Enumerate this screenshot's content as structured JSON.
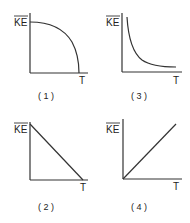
{
  "panels": [
    {
      "id": "1",
      "caption": "( 1 )",
      "ylabel": "KE",
      "xlabel": "T",
      "shape": "quarter-ellipse decreasing (concave down) from max at T=0 to zero"
    },
    {
      "id": "2",
      "caption": "( 2 )",
      "ylabel": "KE",
      "xlabel": "T",
      "shape": "straight line decreasing linearly to zero"
    },
    {
      "id": "3",
      "caption": "( 3 )",
      "ylabel": "KE",
      "xlabel": "T",
      "shape": "hyperbolic decay (inversely proportional)"
    },
    {
      "id": "4",
      "caption": "( 4 )",
      "ylabel": "KE",
      "xlabel": "T",
      "shape": "straight line through origin increasing linearly"
    }
  ],
  "colors": {
    "ink": "#333333",
    "background": "#ffffff"
  }
}
